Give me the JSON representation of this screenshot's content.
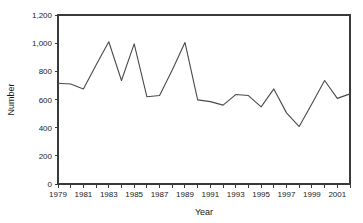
{
  "chart_data": {
    "type": "line",
    "title": "",
    "xlabel": "Year",
    "ylabel": "Number",
    "x": [
      1979,
      1980,
      1981,
      1982,
      1983,
      1984,
      1985,
      1986,
      1987,
      1988,
      1989,
      1990,
      1991,
      1992,
      1993,
      1994,
      1995,
      1996,
      1997,
      1998,
      1999,
      2000,
      2001,
      2002
    ],
    "values": [
      715,
      710,
      675,
      845,
      1010,
      735,
      995,
      620,
      628,
      810,
      1005,
      597,
      585,
      560,
      635,
      628,
      548,
      675,
      505,
      408,
      570,
      735,
      608,
      640
    ],
    "series": [
      {
        "name": "Number",
        "values": [
          715,
          710,
          675,
          845,
          1010,
          735,
          995,
          620,
          628,
          810,
          1005,
          597,
          585,
          560,
          635,
          628,
          548,
          675,
          505,
          408,
          570,
          735,
          608,
          640
        ]
      }
    ],
    "xlim": [
      1979,
      2002
    ],
    "ylim": [
      0,
      1200
    ],
    "ytick_values": [
      0,
      200,
      400,
      600,
      800,
      1000,
      1200
    ],
    "ytick_labels": [
      "0",
      "200",
      "400",
      "600",
      "800",
      "1,000",
      "1,200"
    ],
    "xtick_values": [
      1979,
      1980,
      1981,
      1982,
      1983,
      1984,
      1985,
      1986,
      1987,
      1988,
      1989,
      1990,
      1991,
      1992,
      1993,
      1994,
      1995,
      1996,
      1997,
      1998,
      1999,
      2000,
      2001,
      2002
    ],
    "xtick_labels_shown": [
      "1979",
      "1981",
      "1983",
      "1985",
      "1987",
      "1989",
      "1991",
      "1993",
      "1995",
      "1997",
      "1999",
      "2001"
    ],
    "xtick_label_values": [
      1979,
      1981,
      1983,
      1985,
      1987,
      1989,
      1991,
      1993,
      1995,
      1997,
      1999,
      2001
    ],
    "grid": false,
    "legend": false,
    "legend_position": "none",
    "line_color": "#4a4a4a",
    "axis_color": "#3a3a3a",
    "background_color": "#ffffff"
  },
  "layout": {
    "plot_left": 58,
    "plot_right": 350,
    "plot_top": 15,
    "plot_bottom": 184,
    "width": 363,
    "height": 223
  }
}
